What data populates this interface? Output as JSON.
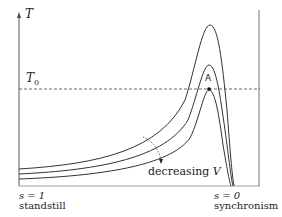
{
  "diagram": {
    "y_axis_label": "T",
    "reference_level_label": "T",
    "reference_level_subscript": "0",
    "point_label": "A",
    "annotation": "decreasing ",
    "annotation_var": "V",
    "left_label_eq": "s = 1",
    "left_label_text": "standstill",
    "right_label_eq": "s = 0",
    "right_label_text": "synchronism",
    "curves": [
      {
        "name": "highest-voltage",
        "peak_y": 25
      },
      {
        "name": "medium-voltage",
        "peak_y": 65
      },
      {
        "name": "lowest-voltage",
        "peak_y": 90
      }
    ],
    "line_color": "#333333"
  }
}
